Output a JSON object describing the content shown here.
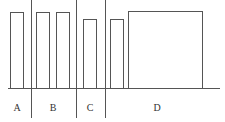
{
  "diagram": {
    "stroke_color": "#555555",
    "baseline": {
      "y": 88,
      "x1": 8,
      "x2": 220
    },
    "bars": [
      {
        "segment": "A",
        "x": 10,
        "width": 13,
        "top": 12
      },
      {
        "segment": "B",
        "x": 36,
        "width": 13,
        "top": 12
      },
      {
        "segment": "B",
        "x": 56,
        "width": 13,
        "top": 12
      },
      {
        "segment": "C",
        "x": 83,
        "width": 13,
        "top": 19
      },
      {
        "segment": "D",
        "x": 110,
        "width": 13,
        "top": 19
      },
      {
        "segment": "D",
        "x": 128,
        "width": 74,
        "top": 11
      }
    ],
    "dividers": [
      {
        "x": 31,
        "y1": 0,
        "y2": 118
      },
      {
        "x": 76,
        "y1": 0,
        "y2": 118
      },
      {
        "x": 105,
        "y1": 0,
        "y2": 118
      }
    ],
    "segments": [
      {
        "label": "A",
        "x": 17
      },
      {
        "label": "B",
        "x": 53
      },
      {
        "label": "C",
        "x": 90
      },
      {
        "label": "D",
        "x": 157
      }
    ],
    "label_y": 103
  }
}
